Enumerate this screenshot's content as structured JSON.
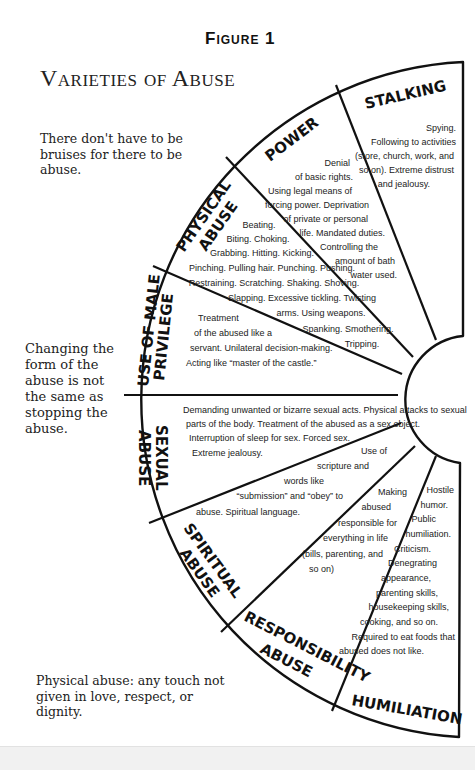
{
  "header": {
    "figure_label": "Figure 1",
    "title": "Varieties of Abuse"
  },
  "side_notes": [
    "There don't have to be bruises for there to be abuse.",
    "Changing the form of the abuse is not the same as stopping the abuse.",
    "Physical abuse: any touch not given in love, respect, or dignity."
  ],
  "wheel": {
    "colors": {
      "stroke": "#111111",
      "fill": "#ffffff"
    },
    "segments": [
      {
        "label": "STALKING",
        "lines": [
          "Spying.",
          "Following to activities",
          "(store, church, work, and",
          "so on). Extreme distrust",
          "and jealousy."
        ]
      },
      {
        "label": "POWER",
        "lines": [
          "Denial",
          "of basic rights.",
          "Using legal means of",
          "forcing power. Deprivation",
          "of private or personal",
          "life. Mandated duties.",
          "Controlling the",
          "amount of bath",
          "water used."
        ]
      },
      {
        "label_lines": [
          "PHYSICAL",
          "ABUSE"
        ],
        "lines": [
          "Beating.",
          "Biting. Choking.",
          "Grabbing. Hitting. Kicking.",
          "Pinching. Pulling hair. Punching. Pushing.",
          "Restraining. Scratching. Shaking. Shoving.",
          "Slapping. Excessive tickling. Twisting",
          "arms. Using weapons.",
          "Spanking. Smothering.",
          "Tripping."
        ]
      },
      {
        "label_lines": [
          "USE OF MALE",
          "PRIVILEGE"
        ],
        "lines": [
          "Treatment",
          "of the abused like a",
          "servant. Unilateral decision-making.",
          "Acting like “master of the castle.”"
        ]
      },
      {
        "label_lines": [
          "SEXUAL",
          "ABUSE"
        ],
        "lines": [
          "Demanding unwanted or bizarre sexual acts. Physical attacks to sexual",
          "parts of the body. Treatment of the abused as a sex object.",
          "Interruption of sleep for sex. Forced sex.",
          "Extreme jealousy."
        ]
      },
      {
        "label_lines": [
          "SPIRITUAL",
          "ABUSE"
        ],
        "lines": [
          "Use of",
          "scripture and",
          "words like",
          "“submission” and “obey” to",
          "abuse. Spiritual language."
        ]
      },
      {
        "label_lines": [
          "RESPONSIBILITY",
          "ABUSE"
        ],
        "lines": [
          "Making",
          "abused",
          "responsible for",
          "everything in life",
          "(bills, parenting, and",
          "so on)"
        ]
      },
      {
        "label": "HUMILIATION",
        "lines": [
          "Hostile",
          "humor.",
          "Public",
          "humiliation.",
          "Criticism.",
          "Denegrating",
          "appearance,",
          "parenting skills,",
          "housekeeping skills,",
          "cooking, and so on.",
          "Required to eat foods that",
          "abused does not like."
        ]
      }
    ]
  }
}
